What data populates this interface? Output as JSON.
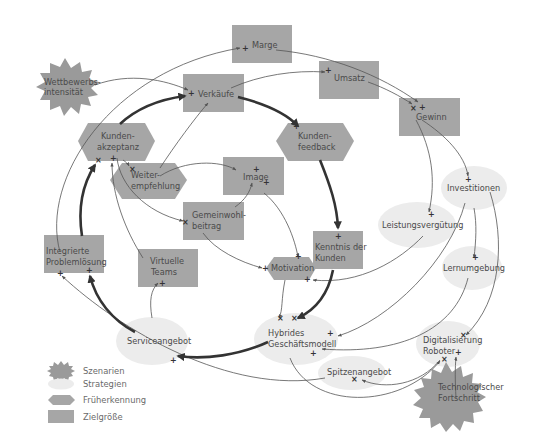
{
  "colors": {
    "zielgroesse": "#a6a6a6",
    "frueherkennung": "#a6a6a6",
    "strategie": "#ececec",
    "szenario": "#9a9a9a",
    "edge": "#555555",
    "edge_bold": "#333333",
    "text": "#4a4a4a"
  },
  "nodes": {
    "marge": {
      "label": "Marge",
      "type": "zielgroesse"
    },
    "umsatz": {
      "label": "Umsatz",
      "type": "zielgroesse"
    },
    "verkaeufe": {
      "label": "Verkäufe",
      "type": "zielgroesse"
    },
    "gewinn": {
      "label": "Gewinn",
      "type": "zielgroesse"
    },
    "wettbewerb": {
      "line1": "Wettbewerbs-",
      "line2": "intensität",
      "type": "szenario"
    },
    "kundenakzeptanz": {
      "line1": "Kunden-",
      "line2": "akzeptanz",
      "type": "frueherkennung"
    },
    "kundenfeedback": {
      "line1": "Kunden-",
      "line2": "feedback",
      "type": "frueherkennung"
    },
    "weiterempfehlung": {
      "line1": "Weiter-",
      "line2": "empfehlung",
      "type": "frueherkennung"
    },
    "image": {
      "label": "Image",
      "type": "zielgroesse"
    },
    "gemeinwohl": {
      "line1": "Gemeinwohl-",
      "line2": "beitrag",
      "type": "zielgroesse"
    },
    "investitionen": {
      "label": "Investitionen",
      "type": "strategie"
    },
    "leistungsverguetung": {
      "label": "Leistungsvergütung",
      "type": "strategie"
    },
    "kenntnis": {
      "line1": "Kenntnis der",
      "line2": "Kunden",
      "type": "zielgroesse"
    },
    "motivation": {
      "label": "Motivation",
      "type": "frueherkennung"
    },
    "lernumgebung": {
      "label": "Lernumgebung",
      "type": "strategie"
    },
    "integrierte": {
      "line1": "Integrierte",
      "line2": "Problemlösung",
      "type": "zielgroesse"
    },
    "virtuelle": {
      "line1": "Virtuelle",
      "line2": "Teams",
      "type": "zielgroesse"
    },
    "serviceangebot": {
      "label": "Serviceangebot",
      "type": "strategie"
    },
    "hybrides": {
      "line1": "Hybrides",
      "line2": "Geschäftsmodell",
      "type": "strategie"
    },
    "digitalisierung": {
      "line1": "Digitalisierung",
      "line2": "Roboter",
      "type": "strategie"
    },
    "spitzenangebot": {
      "label": "Spitzenangebot",
      "type": "strategie"
    },
    "technologischer": {
      "line1": "Technologischer",
      "line2": "Fortschritt",
      "type": "szenario"
    }
  },
  "signs": {
    "plus": "+",
    "cross": "×"
  },
  "legend": {
    "items": [
      {
        "label": "Szenarien",
        "shape": "star-icon"
      },
      {
        "label": "Strategien",
        "shape": "ellipse-icon"
      },
      {
        "label": "Früherkennung",
        "shape": "hexagon-icon"
      },
      {
        "label": "Zielgröße",
        "shape": "rectangle-icon"
      }
    ]
  }
}
